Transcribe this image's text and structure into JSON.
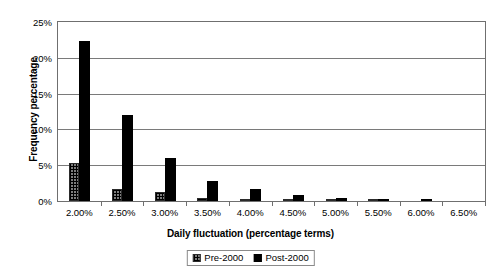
{
  "chart_data": {
    "type": "bar",
    "title": "",
    "xlabel": "Daily fluctuation (percentage terms)",
    "ylabel": "Frequency percentage",
    "categories": [
      "2.00%",
      "2.50%",
      "3.00%",
      "3.50%",
      "4.00%",
      "4.50%",
      "5.00%",
      "5.50%",
      "6.00%",
      "6.50%"
    ],
    "series": [
      {
        "name": "Pre-2000",
        "values": [
          5.3,
          1.7,
          1.2,
          0.4,
          0.2,
          0.1,
          0.05,
          0.05,
          0.0,
          0.0
        ]
      },
      {
        "name": "Post-2000",
        "values": [
          22.4,
          12.0,
          6.0,
          2.8,
          1.7,
          0.8,
          0.4,
          0.3,
          0.05,
          0.0
        ]
      }
    ],
    "ylim": [
      0,
      25
    ],
    "ytick_labels": [
      "0%",
      "5%",
      "10%",
      "15%",
      "20%",
      "25%"
    ],
    "ytick_values": [
      0,
      5,
      10,
      15,
      20,
      25
    ],
    "grid": "horizontal",
    "legend_position": "bottom",
    "colors": {
      "pre_2000": "#7d7d7d",
      "post_2000": "#000000",
      "gridline": "#7a7a7a",
      "border": "#6f6f6f"
    }
  },
  "legend": {
    "entries": [
      {
        "label": "Pre-2000"
      },
      {
        "label": "Post-2000"
      }
    ]
  }
}
